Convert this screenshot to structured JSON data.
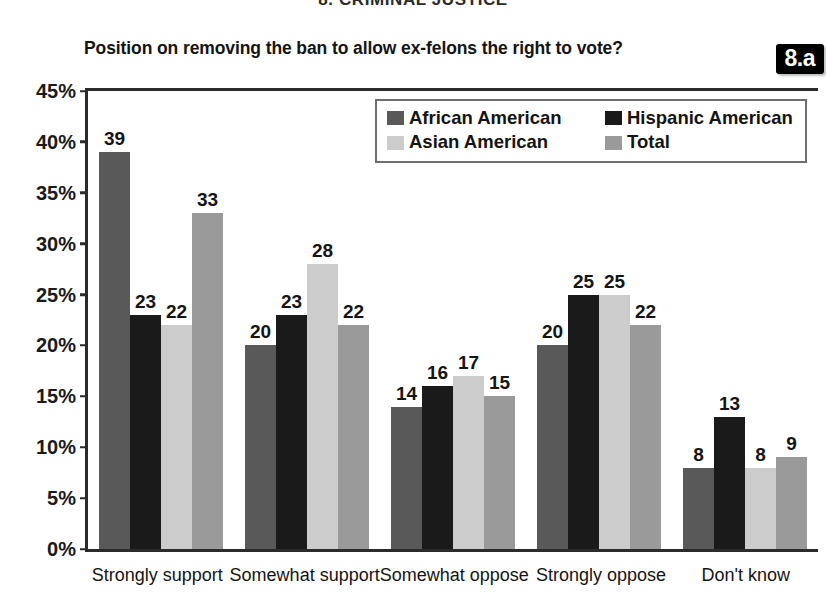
{
  "section_header": "8. CRIMINAL JUSTICE",
  "badge": "8.a",
  "axis": {
    "yticks": [
      "45%",
      "40%",
      "35%",
      "30%",
      "25%",
      "20%",
      "15%",
      "10%",
      "5%",
      "0%"
    ]
  },
  "legend": {
    "entries": [
      {
        "label": "African American",
        "color": "#595959"
      },
      {
        "label": "Hispanic American",
        "color": "#1a1a1a"
      },
      {
        "label": "Asian American",
        "color": "#cccccc"
      },
      {
        "label": "Total",
        "color": "#9a9a9a"
      }
    ]
  },
  "chart_data": {
    "type": "bar",
    "title": "Position on removing the ban to allow ex-felons the right to vote?",
    "xlabel": "",
    "ylabel": "",
    "ylim": [
      0,
      45
    ],
    "ytick_step": 5,
    "grid": false,
    "legend_position": "top-right-inside",
    "categories": [
      "Strongly support",
      "Somewhat support",
      "Somewhat oppose",
      "Strongly oppose",
      "Don't know"
    ],
    "series": [
      {
        "name": "African American",
        "color": "#595959",
        "values": [
          39,
          20,
          14,
          20,
          8
        ]
      },
      {
        "name": "Hispanic American",
        "color": "#1a1a1a",
        "values": [
          23,
          23,
          16,
          25,
          13
        ]
      },
      {
        "name": "Asian American",
        "color": "#cccccc",
        "values": [
          22,
          28,
          17,
          25,
          8
        ]
      },
      {
        "name": "Total",
        "color": "#9a9a9a",
        "values": [
          33,
          22,
          15,
          22,
          9
        ]
      }
    ]
  }
}
